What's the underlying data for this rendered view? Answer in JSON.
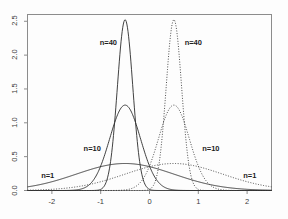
{
  "chart_data": {
    "type": "line",
    "title": "",
    "xlabel": "",
    "ylabel": "",
    "xlim": [
      -2.5,
      2.5
    ],
    "ylim": [
      0.0,
      2.6
    ],
    "grid": false,
    "legend_position": "inline-annotations",
    "xticks": [
      -2,
      -1,
      0,
      1,
      2
    ],
    "xtick_labels": [
      "-2",
      "-1",
      "0",
      "1",
      "2"
    ],
    "yticks": [
      0.0,
      0.5,
      1.0,
      1.5,
      2.0,
      2.5
    ],
    "ytick_labels": [
      "0.0",
      "0.5",
      "1.0",
      "1.5",
      "2.0",
      "2.5"
    ],
    "frame": "box",
    "series": [
      {
        "name": "n=1 (left)",
        "mean": -0.5,
        "sd": 1.0,
        "peak": 0.399,
        "linestyle": "solid",
        "color": "#2b2b2b"
      },
      {
        "name": "n=10 (left)",
        "mean": -0.5,
        "sd": 0.3162,
        "peak": 1.262,
        "linestyle": "solid",
        "color": "#2b2b2b"
      },
      {
        "name": "n=40 (left)",
        "mean": -0.5,
        "sd": 0.1581,
        "peak": 2.523,
        "linestyle": "solid",
        "color": "#2b2b2b"
      },
      {
        "name": "n=1 (right)",
        "mean": 0.5,
        "sd": 1.0,
        "peak": 0.399,
        "linestyle": "dotted",
        "color": "#3a3a3a"
      },
      {
        "name": "n=10 (right)",
        "mean": 0.5,
        "sd": 0.3162,
        "peak": 1.262,
        "linestyle": "dotted",
        "color": "#3a3a3a"
      },
      {
        "name": "n=40 (right)",
        "mean": 0.5,
        "sd": 0.1581,
        "peak": 2.523,
        "linestyle": "dotted",
        "color": "#3a3a3a"
      }
    ],
    "annotations": [
      {
        "text": "n=40",
        "x": -1.02,
        "y": 2.18,
        "side": "left"
      },
      {
        "text": "n=40",
        "x": 0.72,
        "y": 2.18,
        "side": "right"
      },
      {
        "text": "n=10",
        "x": -1.35,
        "y": 0.62,
        "side": "left"
      },
      {
        "text": "n=10",
        "x": 1.08,
        "y": 0.62,
        "side": "right"
      },
      {
        "text": "n=1",
        "x": -2.22,
        "y": 0.22,
        "side": "left"
      },
      {
        "text": "n=1",
        "x": 1.92,
        "y": 0.22,
        "side": "right"
      }
    ]
  },
  "axes": {
    "x_tick_labels": [
      "-2",
      "-1",
      "0",
      "1",
      "2"
    ],
    "y_tick_labels": [
      "0.0",
      "0.5",
      "1.0",
      "1.5",
      "2.0",
      "2.5"
    ]
  },
  "labels": {
    "left_n40": "n=40",
    "right_n40": "n=40",
    "left_n10": "n=10",
    "right_n10": "n=10",
    "left_n1": "n=1",
    "right_n1": "n=1"
  },
  "colors": {
    "background": "#fdfdfd",
    "frame": "#8c8c8c",
    "solid_curve": "#2b2b2b",
    "dotted_curve": "#3a3a3a",
    "tick_text": "#3a3a3a"
  }
}
